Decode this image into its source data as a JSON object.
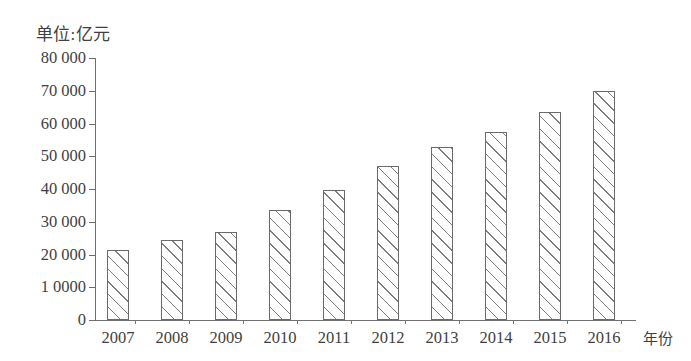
{
  "chart_data": {
    "type": "bar",
    "title": "单位:亿元",
    "xlabel": "年份",
    "ylabel": "",
    "categories": [
      "2007",
      "2008",
      "2009",
      "2010",
      "2011",
      "2012",
      "2013",
      "2014",
      "2015",
      "2016"
    ],
    "values": [
      21500,
      24500,
      26800,
      33600,
      39800,
      47000,
      52800,
      57500,
      63500,
      70000
    ],
    "ylim": [
      0,
      80000
    ],
    "ytick_values": [
      0,
      10000,
      20000,
      30000,
      40000,
      50000,
      60000,
      70000,
      80000
    ],
    "ytick_labels": [
      "0",
      "1 0000",
      "20 000",
      "30 000",
      "40 000",
      "50 000",
      "60 000",
      "70 000",
      "80 000"
    ],
    "grid": false,
    "legend": null,
    "bar_fill": "diagonal-hatch",
    "bar_outline_color": "#6a6a6a",
    "axis_color": "#707070",
    "text_color": "#3f3f3f",
    "background_color": "#ffffff"
  }
}
